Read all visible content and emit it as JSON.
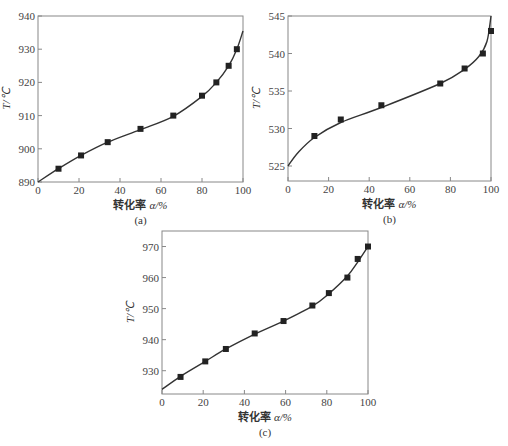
{
  "chart_data": [
    {
      "id": "a",
      "type": "scatter",
      "caption": "(a)",
      "title": "",
      "xlabel": "转化率 α/%",
      "xlabel_prefix": "转化率",
      "xlabel_symbol": "α",
      "xlabel_suffix": "/%",
      "ylabel": "T/℃",
      "xlim": [
        0,
        100
      ],
      "ylim": [
        890,
        940
      ],
      "xticks": [
        0,
        20,
        40,
        60,
        80,
        100
      ],
      "yticks": [
        890,
        900,
        910,
        920,
        930,
        940
      ],
      "grid": false,
      "series": [
        {
          "name": "measured",
          "type": "scatter",
          "x": [
            10,
            21,
            34,
            50,
            66,
            80,
            87,
            93,
            97
          ],
          "y": [
            894,
            898,
            902,
            906,
            910,
            916,
            920,
            925,
            930
          ]
        },
        {
          "name": "fit",
          "type": "line",
          "x": [
            0,
            10,
            21,
            34,
            50,
            66,
            80,
            87,
            93,
            97,
            100
          ],
          "y": [
            890,
            894,
            898,
            902,
            905.8,
            909.8,
            915.8,
            920,
            925,
            930,
            935.5
          ]
        }
      ]
    },
    {
      "id": "b",
      "type": "scatter",
      "caption": "(b)",
      "title": "",
      "xlabel": "转化率 α/%",
      "xlabel_prefix": "转化率",
      "xlabel_symbol": "α",
      "xlabel_suffix": "/%",
      "ylabel": "T/℃",
      "xlim": [
        0,
        100
      ],
      "ylim": [
        523,
        545
      ],
      "xticks": [
        0,
        20,
        40,
        60,
        80,
        100
      ],
      "yticks": [
        525,
        530,
        535,
        540,
        545
      ],
      "grid": false,
      "series": [
        {
          "name": "measured",
          "type": "scatter",
          "x": [
            13,
            26,
            46,
            75,
            87,
            96,
            100
          ],
          "y": [
            529,
            531.2,
            533.1,
            536,
            538,
            540,
            543
          ]
        },
        {
          "name": "fit",
          "type": "line",
          "x": [
            0,
            5,
            13,
            26,
            46,
            75,
            87,
            94,
            98,
            100
          ],
          "y": [
            525,
            526.8,
            528.8,
            530.8,
            532.8,
            536,
            537.9,
            539.6,
            541.6,
            545
          ]
        }
      ]
    },
    {
      "id": "c",
      "type": "scatter",
      "caption": "(c)",
      "title": "",
      "xlabel": "转化率 α/%",
      "xlabel_prefix": "转化率",
      "xlabel_symbol": "α",
      "xlabel_suffix": "/%",
      "ylabel": "T/℃",
      "xlim": [
        0,
        100
      ],
      "ylim": [
        922.5,
        975
      ],
      "xticks": [
        0,
        20,
        40,
        60,
        80,
        100
      ],
      "yticks": [
        930,
        940,
        950,
        960,
        970
      ],
      "grid": false,
      "series": [
        {
          "name": "measured",
          "type": "scatter",
          "x": [
            9,
            21,
            31,
            45,
            59,
            73,
            81,
            90,
            95,
            100
          ],
          "y": [
            928,
            933,
            937,
            942,
            946,
            951,
            955,
            960,
            966,
            970
          ]
        },
        {
          "name": "fit",
          "type": "line",
          "x": [
            0,
            9,
            21,
            31,
            45,
            59,
            73,
            81,
            90,
            95,
            100
          ],
          "y": [
            924,
            928.2,
            933,
            937,
            941.8,
            946,
            950.8,
            954.8,
            960.5,
            965,
            970
          ]
        }
      ]
    }
  ]
}
